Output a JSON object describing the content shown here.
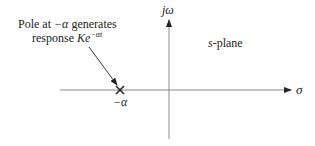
{
  "diagram": {
    "annotation": {
      "line1_prefix": "Pole at ",
      "line1_symbol": "−α",
      "line1_suffix": " generates",
      "line2_prefix": "response ",
      "line2_K": "K",
      "line2_e": "e",
      "line2_exp": "−αt"
    },
    "plane_label": {
      "italic": "s",
      "rest": "-plane"
    },
    "axes": {
      "imag_label": "jω",
      "real_label": "σ"
    },
    "pole": {
      "marker": "X",
      "label": "−α"
    },
    "colors": {
      "axis": "#8a8a8a",
      "text": "#222222",
      "arrow": "#333333"
    }
  }
}
